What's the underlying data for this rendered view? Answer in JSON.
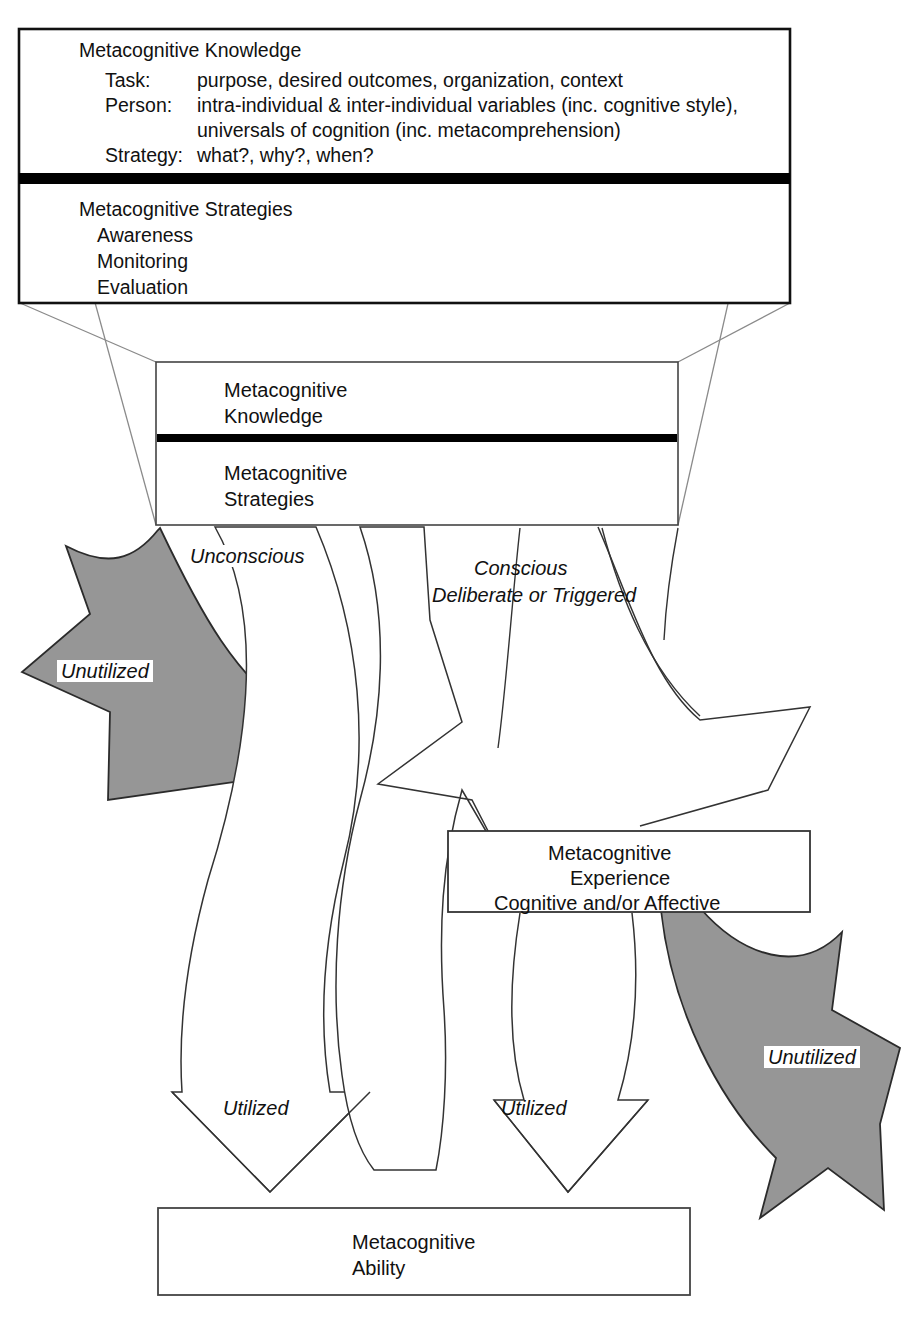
{
  "diagram": {
    "title_implicit": "Metacognition model",
    "colors": {
      "ink": "#111111",
      "line": "#444444",
      "gray_fill": "#969696",
      "gray_stroke": "#2b2b2b",
      "white": "#ffffff",
      "black_bar": "#000000"
    },
    "top_box": {
      "knowledge_heading": "Metacognitive Knowledge",
      "rows": [
        {
          "label": "Task:",
          "value": "purpose, desired outcomes, organization, context"
        },
        {
          "label": "Person:",
          "value": "intra-individual & inter-individual variables (inc. cognitive style),"
        },
        {
          "label": "",
          "value": "universals of cognition (inc. metacomprehension)"
        },
        {
          "label": "Strategy:",
          "value": "what?, why?, when?"
        }
      ],
      "strategies_heading": "Metacognitive Strategies",
      "strategies_items": [
        "Awareness",
        "Monitoring",
        "Evaluation"
      ]
    },
    "middle_box": {
      "upper_line1": "Metacognitive",
      "upper_line2": "Knowledge",
      "lower_line1": "Metacognitive",
      "lower_line2": "Strategies"
    },
    "experience_box": {
      "line1": "Metacognitive",
      "line2": "Experience",
      "line3": "Cognitive and/or Affective"
    },
    "ability_box": {
      "line1": "Metacognitive",
      "line2": "Ability"
    },
    "flow_labels": {
      "unconscious": "Unconscious",
      "conscious_line1": "Conscious",
      "conscious_line2": "Deliberate or Triggered",
      "unutilized_left": "Unutilized",
      "unutilized_right": "Unutilized",
      "utilized_left": "Utilized",
      "utilized_right": "Utilized"
    }
  }
}
